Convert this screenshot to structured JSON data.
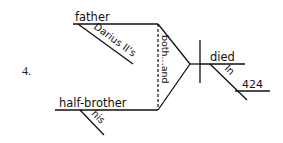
{
  "problem": {
    "number_label": "4."
  },
  "diagram": {
    "type": "sentence-diagram",
    "stroke_color": "#111111",
    "subjects": [
      {
        "word": "father",
        "modifiers": [
          "Darius II's"
        ]
      },
      {
        "word": "half-brother",
        "modifiers": [
          "his"
        ]
      }
    ],
    "conjunction": "both...and",
    "predicate": {
      "verb": "died",
      "prepositional_phrase": {
        "preposition": "In",
        "object": "424"
      }
    }
  }
}
